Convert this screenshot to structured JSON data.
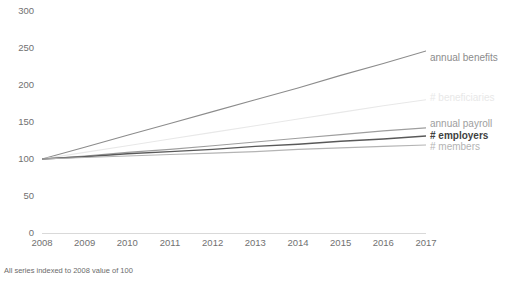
{
  "chart_data": {
    "type": "line",
    "title": "",
    "xlabel": "",
    "ylabel": "",
    "x": [
      2008,
      2009,
      2010,
      2011,
      2012,
      2013,
      2014,
      2015,
      2016,
      2017
    ],
    "categories": [
      "2008",
      "2009",
      "2010",
      "2011",
      "2012",
      "2013",
      "2014",
      "2015",
      "2016",
      "2017"
    ],
    "ylim": [
      0,
      300
    ],
    "yticks": [
      0,
      50,
      100,
      150,
      200,
      250,
      300
    ],
    "ytick_labels": [
      "0",
      "50",
      "100",
      "150",
      "200",
      "250",
      "300"
    ],
    "grid": false,
    "legend_position": "right-inline",
    "note": "All series indexed to 2008 value of 100",
    "series": [
      {
        "name": "annual benefits",
        "label": "annual benefits",
        "color": "#8c8c8c",
        "width": 1.1,
        "bold": false,
        "label_y_value": 237,
        "values": [
          100,
          116,
          132,
          148,
          164,
          180,
          196,
          213,
          229,
          246
        ]
      },
      {
        "name": "# beneficiaries",
        "label": "# beneficiaries",
        "color": "#e8e8e8",
        "width": 1.1,
        "bold": false,
        "label_y_value": 183,
        "values": [
          100,
          109,
          118,
          127,
          136,
          145,
          154,
          163,
          172,
          180
        ]
      },
      {
        "name": "annual payroll",
        "label": "annual payroll",
        "color": "#9e9e9e",
        "width": 1.1,
        "bold": false,
        "label_y_value": 147,
        "values": [
          100,
          104,
          109,
          113,
          118,
          123,
          128,
          133,
          138,
          142
        ]
      },
      {
        "name": "# employers",
        "label": "# employers",
        "color": "#595959",
        "width": 1.4,
        "bold": true,
        "label_y_value": 131,
        "values": [
          100,
          103,
          107,
          110,
          113,
          117,
          120,
          124,
          127,
          131
        ]
      },
      {
        "name": "# members",
        "label": "# members",
        "color": "#b4b4b4",
        "width": 1.1,
        "bold": false,
        "label_y_value": 116,
        "values": [
          100,
          102,
          104,
          106,
          108,
          110,
          113,
          115,
          117,
          119
        ]
      }
    ]
  },
  "footnote": {
    "text": "All series indexed to  2008 value of 100"
  }
}
